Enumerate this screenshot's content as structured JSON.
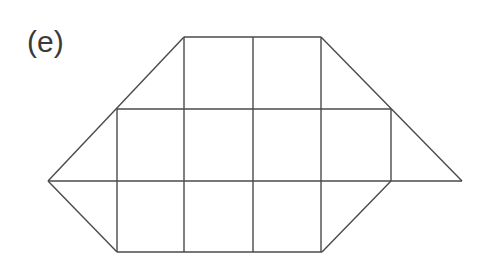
{
  "figure": {
    "label": "(e)",
    "stroke_color": "#4a4a4a"
  },
  "shape": {
    "outline": [
      [
        184,
        37
      ],
      [
        321,
        37
      ],
      [
        391,
        109
      ],
      [
        462,
        181
      ],
      [
        391,
        181
      ],
      [
        322,
        252
      ],
      [
        117,
        252
      ],
      [
        48,
        181
      ],
      [
        117,
        109
      ]
    ],
    "horizontal_lines": [
      {
        "y": 37,
        "x1": 184,
        "x2": 321
      },
      {
        "y": 109,
        "x1": 117,
        "x2": 391
      },
      {
        "y": 181,
        "x1": 48,
        "x2": 462
      },
      {
        "y": 252,
        "x1": 117,
        "x2": 322
      }
    ],
    "vertical_lines": [
      {
        "x": 117,
        "y1": 109,
        "y2": 252
      },
      {
        "x": 184,
        "y1": 37,
        "y2": 252
      },
      {
        "x": 253,
        "y1": 37,
        "y2": 252
      },
      {
        "x": 321,
        "y1": 37,
        "y2": 252
      },
      {
        "x": 391,
        "y1": 109,
        "y2": 181
      }
    ],
    "diagonal_lines": [
      {
        "x1": 184,
        "y1": 37,
        "x2": 48,
        "y2": 181
      },
      {
        "x1": 321,
        "y1": 37,
        "x2": 462,
        "y2": 181
      },
      {
        "x1": 48,
        "y1": 181,
        "x2": 117,
        "y2": 252
      },
      {
        "x1": 391,
        "y1": 181,
        "x2": 322,
        "y2": 252
      }
    ]
  }
}
